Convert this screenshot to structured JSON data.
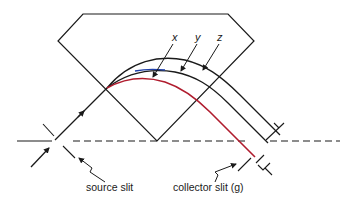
{
  "diagram": {
    "colors": {
      "line": "#1a1a1a",
      "path_x": "#b01c2e",
      "path_y_segment": "#1f3fa8",
      "background": "#ffffff"
    },
    "curve_labels": {
      "x": "x",
      "y": "y",
      "z": "z"
    },
    "slit_labels": {
      "source": "source slit",
      "collector": "collector slit (g)"
    }
  }
}
